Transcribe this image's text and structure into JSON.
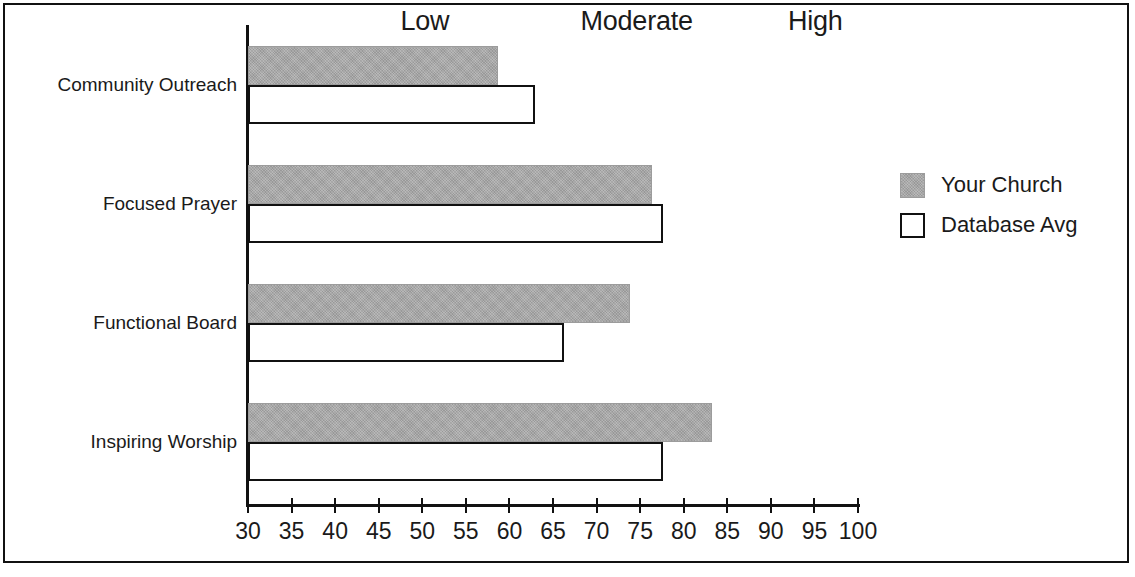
{
  "chart_data": {
    "type": "bar",
    "orientation": "horizontal",
    "title": "",
    "xlabel": "",
    "ylabel": "",
    "xlim": [
      30,
      100
    ],
    "xticks": [
      30,
      35,
      40,
      45,
      50,
      55,
      60,
      65,
      70,
      75,
      80,
      85,
      90,
      95,
      100
    ],
    "grid": false,
    "legend_position": "right",
    "categories": [
      "Community Outreach",
      "Focused Prayer",
      "Functional Board",
      "Inspiring Worship"
    ],
    "series": [
      {
        "name": "Your Church",
        "color": "#a9a9a9",
        "style": "filled-gray",
        "values": [
          58.7,
          76.4,
          73.8,
          83.3
        ]
      },
      {
        "name": "Database Avg",
        "color": "#ffffff",
        "style": "white-outline",
        "values": [
          62.9,
          77.6,
          66.3,
          77.6
        ]
      }
    ],
    "zone_labels": [
      {
        "label": "Low",
        "center_value": "50.3"
      },
      {
        "label": "Moderate",
        "center_value": "74.6"
      },
      {
        "label": "High",
        "center_value": "95.1"
      }
    ]
  },
  "legend": {
    "items": [
      {
        "label": "Your Church",
        "swatch": "filled-gray-square"
      },
      {
        "label": "Database Avg",
        "swatch": "white-outline-square"
      }
    ]
  }
}
